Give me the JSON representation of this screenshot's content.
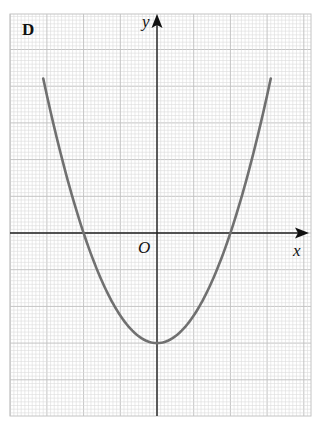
{
  "chart_data": {
    "type": "line",
    "title": "D",
    "xlabel": "x",
    "ylabel": "y",
    "origin_label": "O",
    "grid": true,
    "grid_style": "graph paper (minor squares, major every 10 minor)",
    "axes_ticks_labeled": false,
    "series": [
      {
        "name": "parabola",
        "shape": "upward-opening parabola",
        "vertex": [
          0,
          -3
        ],
        "x_intercepts": [
          -2,
          2
        ],
        "equation_approx": "y = 0.75x^2 - 3",
        "x_range": [
          -3.1,
          3.1
        ],
        "color": "#707070"
      }
    ],
    "units_note": "units in major grid squares; tick values not printed"
  },
  "labels": {
    "panel": "D",
    "y_axis": "y",
    "x_axis": "x",
    "origin": "O"
  },
  "colors": {
    "grid_minor": "#dcdcdc",
    "grid_major": "#c4c4c4",
    "axis": "#222222",
    "curve": "#6e6e6e"
  }
}
